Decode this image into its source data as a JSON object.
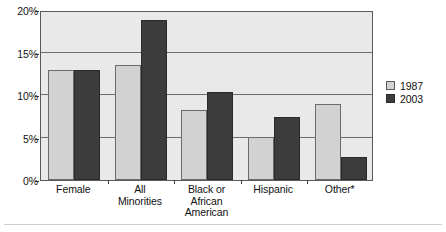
{
  "chart_data": {
    "type": "bar",
    "title": "",
    "xlabel": "",
    "ylabel": "",
    "categories": [
      "Female",
      "All Minorities",
      "Black or African American",
      "Hispanic",
      "Other*"
    ],
    "series": [
      {
        "name": "1987",
        "color": "#d2d2d2",
        "values": [
          12.9,
          13.5,
          8.2,
          5.1,
          8.9
        ]
      },
      {
        "name": "2003",
        "color": "#3c3c3c",
        "values": [
          12.9,
          18.8,
          10.3,
          7.4,
          2.7
        ]
      }
    ],
    "ylim": [
      0,
      20
    ],
    "yticks": [
      0,
      5,
      10,
      15,
      20
    ],
    "ytick_labels": [
      "0%",
      "5%",
      "10%",
      "15%",
      "20%"
    ],
    "grid": true,
    "legend_position": "right"
  },
  "axis": {
    "y_ticks": [
      "20%",
      "15%",
      "10%",
      "5%",
      "0%"
    ]
  },
  "legend": {
    "items": [
      {
        "label": "1987"
      },
      {
        "label": "2003"
      }
    ]
  },
  "categories": [
    {
      "lines": [
        "Female"
      ]
    },
    {
      "lines": [
        "All",
        "Minorities"
      ]
    },
    {
      "lines": [
        "Black or",
        "African",
        "American"
      ]
    },
    {
      "lines": [
        "Hispanic"
      ]
    },
    {
      "lines": [
        "Other*"
      ]
    }
  ]
}
